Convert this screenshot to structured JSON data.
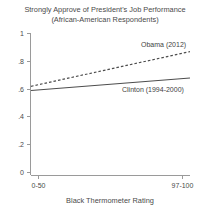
{
  "chart_data": {
    "type": "line",
    "title": "Strongly Approve of President's Job Performance",
    "subtitle": "(African-American Respondents)",
    "xlabel": "Black Thermometer Rating",
    "ylabel": "",
    "x": [
      0,
      1
    ],
    "categories": [
      "0-50",
      "97-100"
    ],
    "xticklabels": [
      "0-50",
      "97-100"
    ],
    "yticklabels": [
      "0",
      ".2",
      ".4",
      ".6",
      ".8",
      "1"
    ],
    "ytickvalues": [
      0,
      0.2,
      0.4,
      0.6,
      0.8,
      1
    ],
    "ylim": [
      0,
      1
    ],
    "xlim": [
      0,
      1
    ],
    "grid": false,
    "legend_position": "inline-annotation",
    "series": [
      {
        "name": "Obama (2012)",
        "style": "dashed",
        "values": [
          0.62,
          0.87
        ],
        "label": "Obama (2012)"
      },
      {
        "name": "Clinton (1994-2000)",
        "style": "solid",
        "values": [
          0.59,
          0.68
        ],
        "label": "Clinton (1994-2000)"
      }
    ],
    "annotations": [
      {
        "text": "Obama (2012)",
        "series": "Obama (2012)"
      },
      {
        "text": "Clinton (1994-2000)",
        "series": "Clinton (1994-2000)"
      }
    ]
  }
}
